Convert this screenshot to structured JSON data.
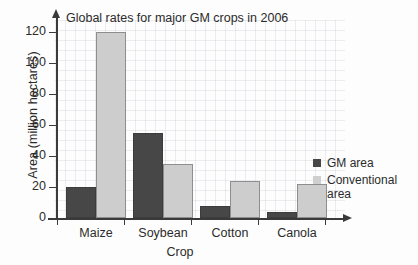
{
  "chart_data": {
    "type": "bar",
    "title": "Global rates for major GM crops in 2006",
    "xlabel": "Crop",
    "ylabel": "Area (million hectares)",
    "categories": [
      "Maize",
      "Soybean",
      "Cotton",
      "Canola"
    ],
    "series": [
      {
        "name": "GM area",
        "color": "#474747",
        "values": [
          20,
          55,
          8,
          4
        ]
      },
      {
        "name": "Conventional area",
        "color": "#cdcdcd",
        "values": [
          120,
          35,
          24,
          22
        ]
      }
    ],
    "ylim": [
      0,
      120
    ],
    "yticks": [
      0,
      20,
      40,
      60,
      80,
      100,
      120
    ],
    "ytick_labels": [
      "0",
      "20",
      "40",
      "60",
      "80",
      "100",
      "120"
    ],
    "grid": true,
    "legend_position": "right",
    "legend_entries": [
      "GM area",
      "Conventional area"
    ]
  }
}
